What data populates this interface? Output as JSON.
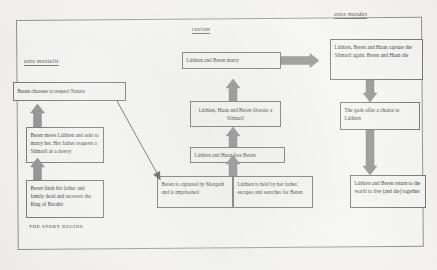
{
  "document": {
    "type": "scanned-diagram",
    "caption": "THE STORY BEGINS"
  },
  "headings": {
    "left": "unio mentalis",
    "center": "caelum",
    "right": "unus mundus"
  },
  "boxes": {
    "left": [
      {
        "id": "respect-nature",
        "text": "Beren chooses to respect Nature"
      },
      {
        "id": "meets-luthien",
        "text": "Beren meets Lúthien and asks to marry her. Her father requests a Silmaril as a dowry"
      },
      {
        "id": "finds-father",
        "text": "Beren finds his father and family dead and recovers the Ring of Barahir"
      }
    ],
    "center": [
      {
        "id": "marry",
        "text": "Lúthien and Beren marry"
      },
      {
        "id": "liberate-silmaril",
        "text": "Lúthien, Huan and Beren liberate a Silmaril"
      },
      {
        "id": "free-beren",
        "text": "Lúthien and Huan free Beren"
      },
      {
        "id": "beren-captured",
        "text": "Beren is captured by Morgoth and is imprisoned"
      },
      {
        "id": "luthien-held",
        "text": "Lúthien is held by her father, escapes and searches for Beren"
      }
    ],
    "right": [
      {
        "id": "capture-again",
        "text": "Lúthien, Beren and Huan capture the Silmaril again. Beren and Huan die"
      },
      {
        "id": "gods-choice",
        "text": "The gods offer a choice to Lúthien"
      },
      {
        "id": "return-world",
        "text": "Lúthien and Beren return to the world to live (and die) together"
      }
    ]
  },
  "colors": {
    "arrow_fill": "#8a8a8a",
    "arrow_stroke": "#6d6d6d",
    "box_border": "#6f6f6f",
    "page_border": "#8e8e8e",
    "paper": "#faf9f6"
  }
}
